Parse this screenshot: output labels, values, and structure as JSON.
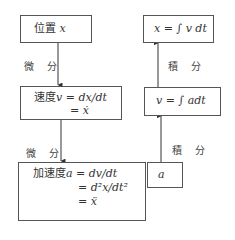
{
  "left_column": {
    "position_box": {
      "label": "位置",
      "symbol": "x"
    },
    "diff_label_1": "微 分",
    "velocity_box": {
      "label": "速度",
      "line1": "v = dx/dt",
      "line2": "= ẋ"
    },
    "diff_label_2": "微 分",
    "acceleration_box": {
      "label": "加速度",
      "line1": "a = dv/dt",
      "line2": "= d²x/dt²",
      "line3": "= ẍ"
    }
  },
  "right_column": {
    "position_box": {
      "text": "x = ∫ v dt"
    },
    "int_label_1": "積 分",
    "velocity_box": {
      "text": "v = ∫ adt"
    },
    "int_label_2": "積 分",
    "acceleration_box": {
      "text": "a"
    }
  }
}
